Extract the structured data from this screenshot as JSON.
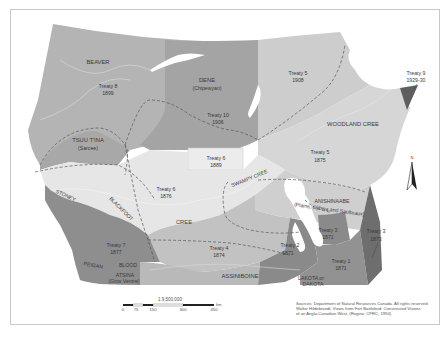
{
  "map": {
    "title": "Treaty areas and First Nations of the Canadian Prairies",
    "colors": {
      "frame": "#c8c8c8",
      "treaty8": "#b4b4b4",
      "treaty10_dene": "#a4a4a4",
      "treaty5_1908": "#cdcdcd",
      "treaty5_1875": "#d6d6d6",
      "treaty9": "#5e5e5e",
      "treaty6_1876": "#e6e6e6",
      "treaty6_1889": "#ececec",
      "treaty4": "#c2c2c2",
      "treaty7": "#8e8e8e",
      "treaty2": "#8a8a8a",
      "treaty1": "#929292",
      "treaty3": "#6e6e6e",
      "tsuu_tina": "#a8a8a8",
      "assiniboine": "#b9b9b9",
      "water": "#ffffff",
      "boundary_dash": "#555555",
      "river": "#e2e2e2"
    },
    "labels": {
      "beaver": "BEAVER",
      "treaty8": "Treaty 8",
      "treaty8_year": "1899",
      "dene": "DENE",
      "dene_sub": "(Chipewyan)",
      "treaty10": "Treaty 10",
      "treaty10_year": "1906",
      "treaty5a": "Treaty 5",
      "treaty5a_year": "1908",
      "treaty9": "Treaty 9",
      "treaty9_year": "1929-30",
      "woodland_cree": "WOODLAND CREE",
      "treaty5b": "Treaty 5",
      "treaty5b_year": "1875",
      "tsuu_tina": "TSUU T'INA",
      "tsuu_tina_sub": "(Sarcee)",
      "treaty6a": "Treaty 6",
      "treaty6a_year": "1889",
      "swampy_cree": "SWAMPY CREE",
      "stoney": "STONEY",
      "blackfoot": "BLACKFOOT",
      "treaty6b": "Treaty 6",
      "treaty6b_year": "1876",
      "cree": "CREE",
      "anishinaabe": "ANISHINAABE",
      "anishinaabe_sub": "(Plains, Ojibwa and Saulteaux)",
      "treaty7": "Treaty 7",
      "treaty7_year": "1877",
      "treaty4": "Treaty 4",
      "treaty4_year": "1874",
      "treaty2": "Treaty 2",
      "treaty2_year": "1871",
      "treaty3_inner": "Treaty 3",
      "treaty3_inner_year": "1871",
      "treaty3": "Treaty 3",
      "treaty3_year": "1873",
      "treaty1": "Treaty 1",
      "treaty1_year": "1871",
      "peigan": "PEIGAN",
      "blood": "BLOOD",
      "atsina": "ATSINA",
      "atsina_sub": "(Gros Ventre)",
      "assiniboine": "ASSINIBOINE",
      "lakota": "LAKOTA or",
      "dakota": "DAKOTA"
    },
    "north_arrow": {
      "label": "N"
    },
    "scale_bar": {
      "ratio": "1:9,500,000",
      "ticks": [
        "0",
        "75",
        "150",
        "300",
        "450"
      ],
      "unit": "km"
    },
    "sources": [
      "Sources: Department of Natural Resources Canada. All rights reserved.",
      "Walter Hildebrandt, Views from Fort Battleford: Constructed Visions",
      "of an Anglo-Canadian West, (Regina: CPRC, 1994)"
    ]
  }
}
